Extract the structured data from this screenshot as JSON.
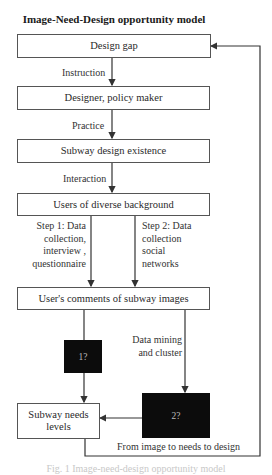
{
  "title": "Image-Need-Design opportunity model",
  "nodes": {
    "design_gap": "Design gap",
    "designer": "Designer, policy maker",
    "existence": "Subway design existence",
    "users": "Users of diverse background",
    "comments": "User's comments of subway images",
    "box1": "1?",
    "box2": "2?",
    "needs_line1": "Subway needs",
    "needs_line2": "levels"
  },
  "edges": {
    "instruction": "Instruction",
    "practice": "Practice",
    "interaction": "Interaction",
    "step1": [
      "Step 1: Data",
      "collection,",
      "interview ,",
      "questionnaire"
    ],
    "step2": [
      "Step 2: Data",
      "collection",
      "social",
      "networks"
    ],
    "mining": [
      "Data mining",
      "and cluster"
    ],
    "feedback": "From image to needs to design"
  },
  "caption": "Fig. 1   Image-need-design opportunity model",
  "colors": {
    "line": "#3a3a3a",
    "black_box": "#0c0c0c",
    "border": "#555555"
  }
}
